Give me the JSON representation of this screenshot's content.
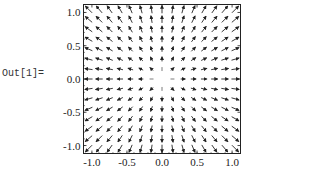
{
  "cell": {
    "output_label": "Out[1]="
  },
  "chart_data": {
    "type": "vector_field",
    "title": "",
    "field": "{x, y}",
    "grid": {
      "nx": 15,
      "ny": 15
    },
    "xlim": [
      -1.12,
      1.12
    ],
    "ylim": [
      -1.12,
      1.12
    ],
    "xticks": [
      -1.0,
      -0.5,
      0.0,
      0.5,
      1.0
    ],
    "yticks": [
      -1.0,
      -0.5,
      0.0,
      0.5,
      1.0
    ],
    "xtick_labels": [
      "-1.0",
      "-0.5",
      "0.0",
      "0.5",
      "1.0"
    ],
    "ytick_labels": [
      "1.0",
      "0.5",
      "0.0",
      "-0.5",
      "-1.0"
    ],
    "xlabel": "",
    "ylabel": "",
    "frame": true,
    "arrow_color": "#222222"
  }
}
